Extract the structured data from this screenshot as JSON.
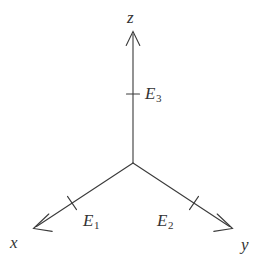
{
  "figure": {
    "kind": "3d-coordinate-axes-diagram",
    "background_color": "#ffffff",
    "stroke_color": "#3a3a3a",
    "text_color": "#333333",
    "width": 267,
    "height": 269
  },
  "origin": {
    "x": 133,
    "y": 163
  },
  "axes": [
    {
      "id": "z",
      "label": "z",
      "label_pos": {
        "x": 127,
        "y": 9
      },
      "from": {
        "x": 133,
        "y": 163
      },
      "to": {
        "x": 133,
        "y": 32
      },
      "arrow": "open",
      "tick": {
        "x": 133,
        "y": 94
      },
      "basis_label": "E",
      "basis_subscript": "3",
      "basis_label_pos": {
        "x": 145,
        "y": 85
      }
    },
    {
      "id": "x",
      "label": "x",
      "label_pos": {
        "x": 10,
        "y": 234
      },
      "from": {
        "x": 133,
        "y": 163
      },
      "to": {
        "x": 34,
        "y": 228
      },
      "arrow": "open",
      "tick": {
        "x": 72,
        "y": 203
      },
      "basis_label": "E",
      "basis_subscript": "1",
      "basis_label_pos": {
        "x": 83,
        "y": 212
      }
    },
    {
      "id": "y",
      "label": "y",
      "label_pos": {
        "x": 241,
        "y": 236
      },
      "from": {
        "x": 133,
        "y": 163
      },
      "to": {
        "x": 232,
        "y": 228
      },
      "arrow": "open",
      "tick": {
        "x": 194,
        "y": 203
      },
      "basis_label": "E",
      "basis_subscript": "2",
      "basis_label_pos": {
        "x": 157,
        "y": 212
      }
    }
  ]
}
